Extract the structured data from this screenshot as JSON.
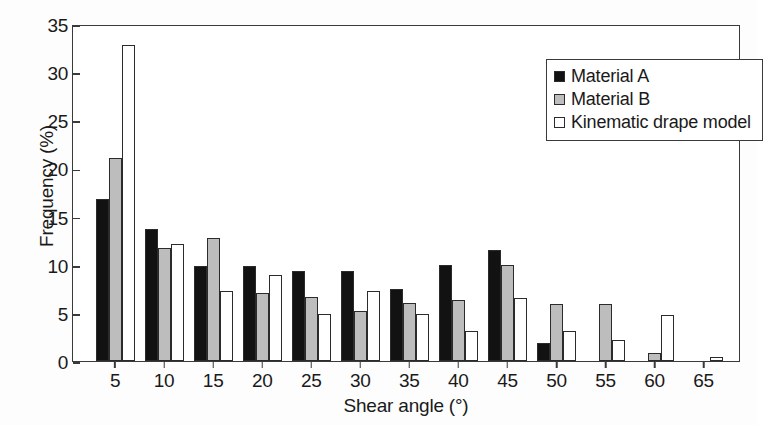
{
  "chart_data": {
    "type": "bar",
    "title": "",
    "xlabel": "Shear angle (°)",
    "ylabel": "Frequency (%)",
    "categories": [
      "5",
      "10",
      "15",
      "20",
      "25",
      "30",
      "35",
      "40",
      "45",
      "50",
      "55",
      "60",
      "65"
    ],
    "xtick_labels": [
      "5",
      "10",
      "15",
      "20",
      "25",
      "30",
      "35",
      "40",
      "45",
      "50",
      "55",
      "60",
      "65"
    ],
    "ytick_labels": [
      "0",
      "5",
      "10",
      "15",
      "20",
      "25",
      "30",
      "35"
    ],
    "ytick_values": [
      0,
      5,
      10,
      15,
      20,
      25,
      30,
      35
    ],
    "ylim": [
      0,
      35
    ],
    "grid": false,
    "legend_position": "upper right",
    "series": [
      {
        "name": "Material A",
        "color": "#121212",
        "style": "filled-black",
        "values": [
          16.8,
          13.7,
          9.9,
          9.9,
          9.3,
          9.3,
          7.5,
          10.0,
          11.5,
          1.9,
          0,
          0,
          0
        ]
      },
      {
        "name": "Material B",
        "color": "#bdbdbd",
        "style": "filled-gray",
        "values": [
          21.1,
          11.7,
          12.8,
          7.1,
          6.7,
          5.2,
          6.0,
          6.3,
          10.0,
          5.9,
          5.9,
          0.8,
          0
        ]
      },
      {
        "name": "Kinematic drape model",
        "color": "#ffffff",
        "style": "open-outline",
        "values": [
          32.8,
          12.2,
          7.3,
          8.9,
          4.9,
          7.3,
          4.9,
          3.1,
          6.5,
          3.1,
          2.2,
          4.8,
          0.4
        ]
      }
    ]
  },
  "legend": {
    "entries": [
      {
        "label": "Material A",
        "swatch": "black-square-icon"
      },
      {
        "label": "Material B",
        "swatch": "gray-square-icon"
      },
      {
        "label": "Kinematic drape model",
        "swatch": "white-square-icon"
      }
    ]
  },
  "axes": {
    "x_title": "Shear angle (°)",
    "y_title": "Frequency (%)"
  },
  "colors": {
    "series_a": "#121212",
    "series_b": "#bdbdbd",
    "series_c": "#ffffff",
    "axis": "#3a3a3a",
    "background": "#ffffff"
  }
}
